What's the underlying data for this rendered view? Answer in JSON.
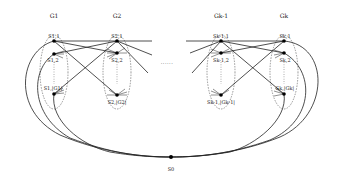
{
  "diagram": {
    "groups": [
      {
        "label": "G1",
        "x": 54
      },
      {
        "label": "G2",
        "x": 117
      },
      {
        "label": "Gk-1",
        "x": 221
      },
      {
        "label": "Gk",
        "x": 284
      }
    ],
    "nodes": [
      {
        "label": "S1,1"
      },
      {
        "label": "S1,2"
      },
      {
        "label": "S1,|G1|"
      },
      {
        "label": "S2,1"
      },
      {
        "label": "S2,2"
      },
      {
        "label": "S2,|G2|"
      },
      {
        "label": "Sk-1,1"
      },
      {
        "label": "Sk-1,2"
      },
      {
        "label": "Sk-1,|Gk-1|"
      },
      {
        "label": "Sk,1"
      },
      {
        "label": "Sk,2"
      },
      {
        "label": "Sk,|Gk|"
      }
    ],
    "root": {
      "label": "S0"
    },
    "ellipsis": "......",
    "line_color": "#222222"
  }
}
